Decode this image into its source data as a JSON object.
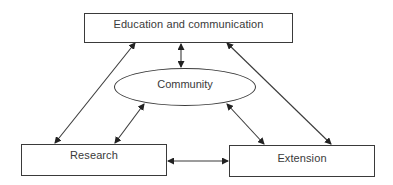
{
  "diagram": {
    "nodes": {
      "education": {
        "label": "Education and communication",
        "shape": "rectangle"
      },
      "community": {
        "label": "Community",
        "shape": "ellipse"
      },
      "research": {
        "label": "Research",
        "shape": "rectangle"
      },
      "extension": {
        "label": "Extension",
        "shape": "rectangle"
      }
    },
    "edges": [
      {
        "from": "education",
        "to": "community",
        "direction": "bidirectional"
      },
      {
        "from": "education",
        "to": "research",
        "direction": "bidirectional"
      },
      {
        "from": "education",
        "to": "extension",
        "direction": "bidirectional"
      },
      {
        "from": "community",
        "to": "research",
        "direction": "bidirectional"
      },
      {
        "from": "community",
        "to": "extension",
        "direction": "bidirectional"
      },
      {
        "from": "research",
        "to": "extension",
        "direction": "bidirectional"
      }
    ],
    "colors": {
      "stroke": "#3a3a3a",
      "text": "#3a3a3a",
      "background": "#ffffff"
    }
  }
}
